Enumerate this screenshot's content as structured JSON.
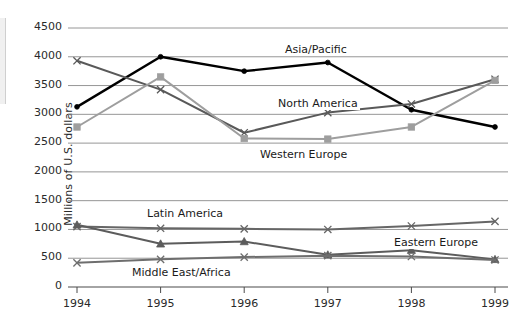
{
  "chart_data": {
    "type": "line",
    "title": "",
    "xlabel": "",
    "ylabel": "Millions of U.S. dollars",
    "categories": [
      "1994",
      "1995",
      "1996",
      "1997",
      "1998",
      "1999"
    ],
    "ylim": [
      0,
      4500
    ],
    "ytick_step": 500,
    "yticks": [
      "4500",
      "4000",
      "3500",
      "3000",
      "2500",
      "2000",
      "1500",
      "1000",
      "500",
      "0"
    ],
    "grid": true,
    "grid_axis": "y",
    "legend": "inline-annotations",
    "series": [
      {
        "name": "Asia/Pacific",
        "color": "#000000",
        "marker": "dot",
        "values": [
          3130,
          4000,
          3750,
          3900,
          3080,
          2780
        ]
      },
      {
        "name": "North America",
        "color": "#595959",
        "marker": "x",
        "values": [
          3930,
          3430,
          2680,
          3030,
          3180,
          3610
        ]
      },
      {
        "name": "Western Europe",
        "color": "#9e9e9e",
        "marker": "square",
        "values": [
          2780,
          3650,
          2580,
          2570,
          2780,
          3590
        ]
      },
      {
        "name": "Latin America",
        "color": "#666666",
        "marker": "x",
        "values": [
          1050,
          1020,
          1010,
          1000,
          1060,
          1140
        ]
      },
      {
        "name": "Eastern Europe",
        "color": "#5c5c5c",
        "marker": "triangle",
        "values": [
          1080,
          750,
          790,
          560,
          640,
          480
        ]
      },
      {
        "name": "Middle East/Africa",
        "color": "#6e6e6e",
        "marker": "x",
        "values": [
          420,
          480,
          520,
          545,
          530,
          470
        ]
      }
    ],
    "annotations": [
      {
        "text": "Asia/Pacific",
        "x": 283,
        "y": 43,
        "name": "series-label-asia-pacific"
      },
      {
        "text": "North America",
        "x": 276,
        "y": 97,
        "name": "series-label-north-america"
      },
      {
        "text": "Western Europe",
        "x": 258,
        "y": 148,
        "name": "series-label-western-europe"
      },
      {
        "text": "Latin America",
        "x": 145,
        "y": 207,
        "name": "series-label-latin-america"
      },
      {
        "text": "Eastern Europe",
        "x": 392,
        "y": 236,
        "name": "series-label-eastern-europe"
      },
      {
        "text": "Middle East/Africa",
        "x": 130,
        "y": 266,
        "name": "series-label-middle-east-africa"
      }
    ]
  }
}
